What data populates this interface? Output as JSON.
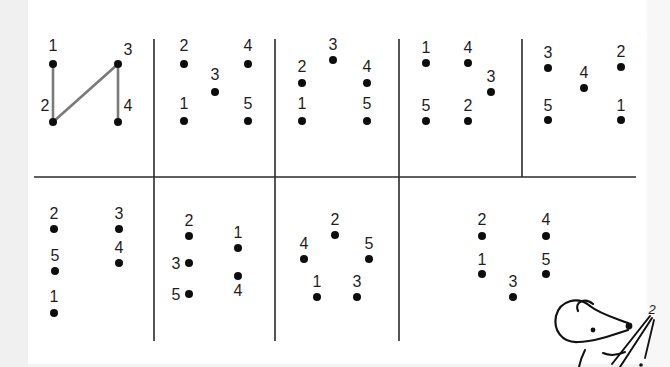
{
  "worksheet": {
    "grid_lines": {
      "horizontal": [
        {
          "x1": 34,
          "y1": 177,
          "x2": 636,
          "y2": 177
        }
      ],
      "vertical": [
        {
          "x1": 154,
          "y1": 39,
          "x2": 154,
          "y2": 341
        },
        {
          "x1": 275,
          "y1": 39,
          "x2": 275,
          "y2": 341
        },
        {
          "x1": 399,
          "y1": 39,
          "x2": 399,
          "y2": 341
        },
        {
          "x1": 522,
          "y1": 39,
          "x2": 522,
          "y2": 177
        }
      ]
    },
    "panels": [
      {
        "id": "top-1",
        "example": true,
        "points": [
          {
            "label": "1",
            "x": 53,
            "y": 64,
            "lx": 53,
            "ly": 51
          },
          {
            "label": "3",
            "x": 118,
            "y": 64,
            "lx": 128,
            "ly": 55
          },
          {
            "label": "2",
            "x": 53,
            "y": 122,
            "lx": 45,
            "ly": 111
          },
          {
            "label": "4",
            "x": 118,
            "y": 122,
            "lx": 128,
            "ly": 111
          }
        ],
        "connections": [
          [
            "1",
            "2"
          ],
          [
            "2",
            "3"
          ],
          [
            "3",
            "4"
          ]
        ]
      },
      {
        "id": "top-2",
        "points": [
          {
            "label": "2",
            "x": 184,
            "y": 64,
            "lx": 184,
            "ly": 51
          },
          {
            "label": "4",
            "x": 248,
            "y": 64,
            "lx": 248,
            "ly": 51
          },
          {
            "label": "3",
            "x": 215,
            "y": 92,
            "lx": 215,
            "ly": 80
          },
          {
            "label": "1",
            "x": 184,
            "y": 121,
            "lx": 184,
            "ly": 109
          },
          {
            "label": "5",
            "x": 248,
            "y": 121,
            "lx": 248,
            "ly": 109
          }
        ]
      },
      {
        "id": "top-3",
        "points": [
          {
            "label": "3",
            "x": 333,
            "y": 60,
            "lx": 333,
            "ly": 50
          },
          {
            "label": "2",
            "x": 302,
            "y": 83,
            "lx": 302,
            "ly": 72
          },
          {
            "label": "4",
            "x": 367,
            "y": 83,
            "lx": 367,
            "ly": 72
          },
          {
            "label": "1",
            "x": 302,
            "y": 121,
            "lx": 302,
            "ly": 109
          },
          {
            "label": "5",
            "x": 367,
            "y": 121,
            "lx": 367,
            "ly": 109
          }
        ]
      },
      {
        "id": "top-4",
        "points": [
          {
            "label": "1",
            "x": 426,
            "y": 63,
            "lx": 426,
            "ly": 53
          },
          {
            "label": "4",
            "x": 468,
            "y": 63,
            "lx": 468,
            "ly": 53
          },
          {
            "label": "3",
            "x": 491,
            "y": 92,
            "lx": 491,
            "ly": 82
          },
          {
            "label": "5",
            "x": 426,
            "y": 121,
            "lx": 426,
            "ly": 111
          },
          {
            "label": "2",
            "x": 468,
            "y": 121,
            "lx": 468,
            "ly": 111
          }
        ]
      },
      {
        "id": "top-5",
        "points": [
          {
            "label": "3",
            "x": 548,
            "y": 68,
            "lx": 548,
            "ly": 58
          },
          {
            "label": "2",
            "x": 621,
            "y": 67,
            "lx": 621,
            "ly": 57
          },
          {
            "label": "4",
            "x": 584,
            "y": 88,
            "lx": 584,
            "ly": 78
          },
          {
            "label": "5",
            "x": 548,
            "y": 120,
            "lx": 548,
            "ly": 111
          },
          {
            "label": "1",
            "x": 621,
            "y": 120,
            "lx": 621,
            "ly": 111
          }
        ]
      },
      {
        "id": "bottom-1",
        "points": [
          {
            "label": "2",
            "x": 54,
            "y": 229,
            "lx": 54,
            "ly": 219
          },
          {
            "label": "3",
            "x": 119,
            "y": 229,
            "lx": 119,
            "ly": 219
          },
          {
            "label": "4",
            "x": 119,
            "y": 263,
            "lx": 119,
            "ly": 253
          },
          {
            "label": "5",
            "x": 55,
            "y": 271,
            "lx": 55,
            "ly": 261
          },
          {
            "label": "1",
            "x": 54,
            "y": 313,
            "lx": 54,
            "ly": 302
          }
        ]
      },
      {
        "id": "bottom-2",
        "points": [
          {
            "label": "2",
            "x": 189,
            "y": 236,
            "lx": 189,
            "ly": 226
          },
          {
            "label": "1",
            "x": 238,
            "y": 248,
            "lx": 238,
            "ly": 238
          },
          {
            "label": "3",
            "x": 189,
            "y": 263,
            "lx": 176,
            "ly": 269
          },
          {
            "label": "4",
            "x": 238,
            "y": 276,
            "lx": 238,
            "ly": 296
          },
          {
            "label": "5",
            "x": 189,
            "y": 294,
            "lx": 176,
            "ly": 300
          }
        ]
      },
      {
        "id": "bottom-3",
        "points": [
          {
            "label": "2",
            "x": 335,
            "y": 235,
            "lx": 335,
            "ly": 225
          },
          {
            "label": "4",
            "x": 304,
            "y": 259,
            "lx": 304,
            "ly": 249
          },
          {
            "label": "5",
            "x": 369,
            "y": 259,
            "lx": 369,
            "ly": 249
          },
          {
            "label": "1",
            "x": 317,
            "y": 297,
            "lx": 317,
            "ly": 287
          },
          {
            "label": "3",
            "x": 357,
            "y": 297,
            "lx": 357,
            "ly": 287
          }
        ]
      },
      {
        "id": "bottom-4",
        "points": [
          {
            "label": "2",
            "x": 482,
            "y": 236,
            "lx": 482,
            "ly": 225
          },
          {
            "label": "4",
            "x": 546,
            "y": 236,
            "lx": 546,
            "ly": 225
          },
          {
            "label": "1",
            "x": 482,
            "y": 274,
            "lx": 482,
            "ly": 265
          },
          {
            "label": "5",
            "x": 546,
            "y": 274,
            "lx": 546,
            "ly": 265
          },
          {
            "label": "3",
            "x": 513,
            "y": 297,
            "lx": 513,
            "ly": 287
          }
        ]
      }
    ],
    "mascot": {
      "description": "cartoon mouse holding a pencil",
      "pencil_label": "2"
    },
    "colors": {
      "dot": "#0d0d0d",
      "line": "#2a2a2a",
      "example_connector": "#7a7a7a",
      "label": "#1e1e1e",
      "paper": "#ffffff",
      "margin": "#f0f0f0"
    }
  }
}
